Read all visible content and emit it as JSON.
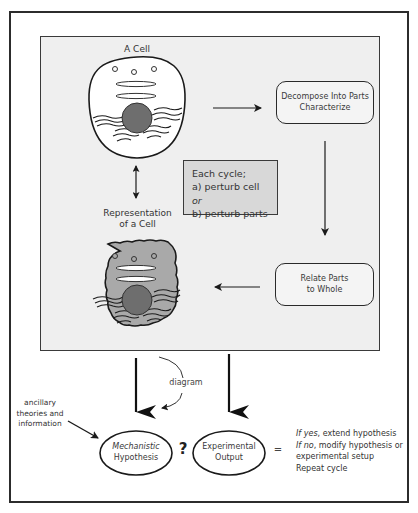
{
  "diagram": {
    "cell": {
      "title": "A Cell",
      "fill": "#ffffff",
      "nucleus_color": "#6e6e6e"
    },
    "representation": {
      "title_line1": "Representation",
      "title_line2": "of a Cell",
      "fill": "#a9a9a9",
      "nucleus_color": "#6e6e6e"
    },
    "decompose_box": {
      "line1": "Decompose Into Parts",
      "line2": "Characterize"
    },
    "relate_box": {
      "line1": "Relate Parts",
      "line2": "to Whole"
    },
    "cycle_box": {
      "line1": "Each cycle;",
      "line2_prefix": "a) perturb cell ",
      "line2_italic": "or",
      "line3": "b) perturb parts",
      "fill": "#d8d8d8"
    },
    "diagram_label": "diagram",
    "ancillary": {
      "line1": "ancillary",
      "line2": "theories and",
      "line3": "information"
    },
    "hypothesis": {
      "line1": "Mechanistic",
      "line2": "Hypothesis"
    },
    "comparison_symbol": "?",
    "experimental": {
      "line1": "Experimental",
      "line2": "Output"
    },
    "equals_symbol": "=",
    "outcome": {
      "yes_prefix": "If yes",
      "yes_text": ", extend hypothesis",
      "no_prefix": "If no",
      "no_text": ", modify hypothesis or",
      "no_text_2": "experimental setup",
      "repeat": "Repeat cycle"
    },
    "panel_fill": "#efefef"
  }
}
